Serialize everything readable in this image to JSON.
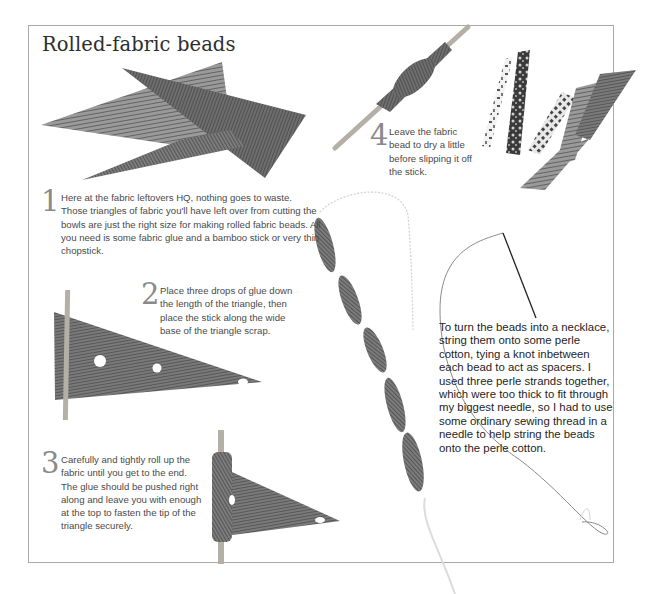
{
  "page": {
    "title": "Rolled-fabric beads"
  },
  "steps": [
    {
      "number": "1",
      "text": "Here at the fabric leftovers HQ, nothing goes to waste. Those triangles of fabric you'll have left over from cutting the bowls are just the right size for making rolled fabric beads. All you need is some fabric glue and a bamboo stick or very thin chopstick."
    },
    {
      "number": "2",
      "text": "Place three drops of glue down the length of the  triangle, then place the stick along the wide base of the triangle scrap."
    },
    {
      "number": "3",
      "text": "Carefully and tightly roll up the fabric until you get to the end. The glue should be pushed right along and leave you with enough at the top to fasten the tip of the triangle securely."
    },
    {
      "number": "4",
      "text": "Leave the fabric bead to dry a little before slipping it off the stick."
    }
  ],
  "note": {
    "text": "To turn the beads into a necklace, string them onto some perle cotton, tying a knot inbetween each bead to act as spacers. I used three perle strands together, which were too thick to fit through my biggest needle, so I had to use some ordinary sewing thread in a needle to help string the beads onto the perle cotton."
  },
  "images": [
    {
      "name": "fabric-triangles-photo",
      "alt": "Leftover fabric triangles"
    },
    {
      "name": "glue-triangle-stick-photo",
      "alt": "Fabric triangle with glue drops and stick"
    },
    {
      "name": "rolling-fabric-photo",
      "alt": "Fabric being rolled on stick"
    },
    {
      "name": "bead-on-stick-photo",
      "alt": "Fabric bead drying on stick"
    },
    {
      "name": "finished-beads-photo",
      "alt": "Finished rolled fabric beads"
    },
    {
      "name": "bead-necklace-photo",
      "alt": "Beads strung into necklace with needle and thread"
    }
  ],
  "colors": {
    "frame": "#a9a9a9",
    "fabric_dark": "#5a5a5a",
    "fabric_light": "#8c8c8c",
    "stick": "#b5b0a6",
    "number": "#8a8a8a"
  }
}
